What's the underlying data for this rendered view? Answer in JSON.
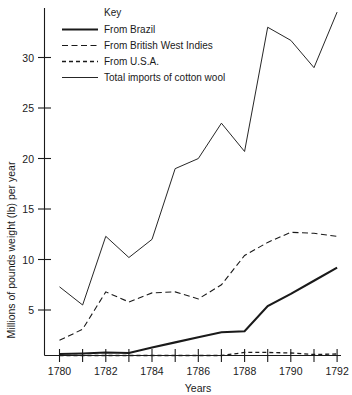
{
  "chart_data": {
    "type": "line",
    "title": "",
    "xlabel": "Years",
    "ylabel": "Millions of pounds weight (lb) per year",
    "legend_title": "Key",
    "legend_position": "inside-top-left",
    "grid": false,
    "xlim": [
      1780,
      1792
    ],
    "ylim": [
      0,
      35
    ],
    "x": [
      1780,
      1781,
      1782,
      1783,
      1784,
      1785,
      1786,
      1787,
      1788,
      1789,
      1790,
      1791,
      1792
    ],
    "xticks": [
      1780,
      1781,
      1782,
      1783,
      1784,
      1785,
      1786,
      1787,
      1788,
      1789,
      1790,
      1791,
      1792
    ],
    "xtick_labels": [
      "1780",
      "",
      "1782",
      "",
      "1784",
      "",
      "1786",
      "",
      "1788",
      "",
      "1790",
      "",
      "1792"
    ],
    "yticks": [
      0,
      5,
      10,
      15,
      20,
      25,
      30
    ],
    "ytick_labels": [
      "",
      "5",
      "10",
      "15",
      "20",
      "25",
      "30"
    ],
    "series": [
      {
        "name": "From Brazil",
        "style": "solid-thick",
        "values": [
          0.15,
          0.2,
          0.3,
          0.25,
          0.8,
          1.3,
          1.8,
          2.3,
          2.4,
          4.9,
          6.1,
          7.4,
          8.7
        ]
      },
      {
        "name": "From British West Indies",
        "style": "long-dash",
        "values": [
          1.5,
          2.6,
          6.3,
          5.3,
          6.2,
          6.3,
          5.6,
          7.0,
          9.9,
          11.2,
          12.2,
          12.1,
          11.8
        ]
      },
      {
        "name": "From U.S.A.",
        "style": "short-dash",
        "values": [
          0.0,
          0.0,
          0.0,
          0.0,
          0.0,
          0.0,
          0.0,
          0.0,
          0.3,
          0.3,
          0.25,
          0.1,
          0.15
        ]
      },
      {
        "name": "Total imports of cotton wool",
        "style": "solid-thin",
        "values": [
          6.8,
          5.0,
          11.8,
          9.7,
          11.5,
          18.5,
          19.5,
          23.0,
          20.2,
          32.5,
          31.2,
          28.5,
          34.0
        ]
      }
    ]
  },
  "legend": {
    "title": "Key",
    "entries": [
      {
        "label": "From Brazil",
        "swatch": "solid-thick"
      },
      {
        "label": "From British West Indies",
        "swatch": "long-dash"
      },
      {
        "label": "From U.S.A.",
        "swatch": "short-dash"
      },
      {
        "label": "Total imports of cotton wool",
        "swatch": "solid-thin"
      }
    ]
  },
  "axes": {
    "y_title": "Millions of pounds weight (lb) per year",
    "x_title": "Years",
    "y_labels": [
      "30",
      "25",
      "20",
      "15",
      "10",
      "5"
    ],
    "x_labels": [
      "1780",
      "1782",
      "1784",
      "1786",
      "1788",
      "1790",
      "1792"
    ]
  }
}
